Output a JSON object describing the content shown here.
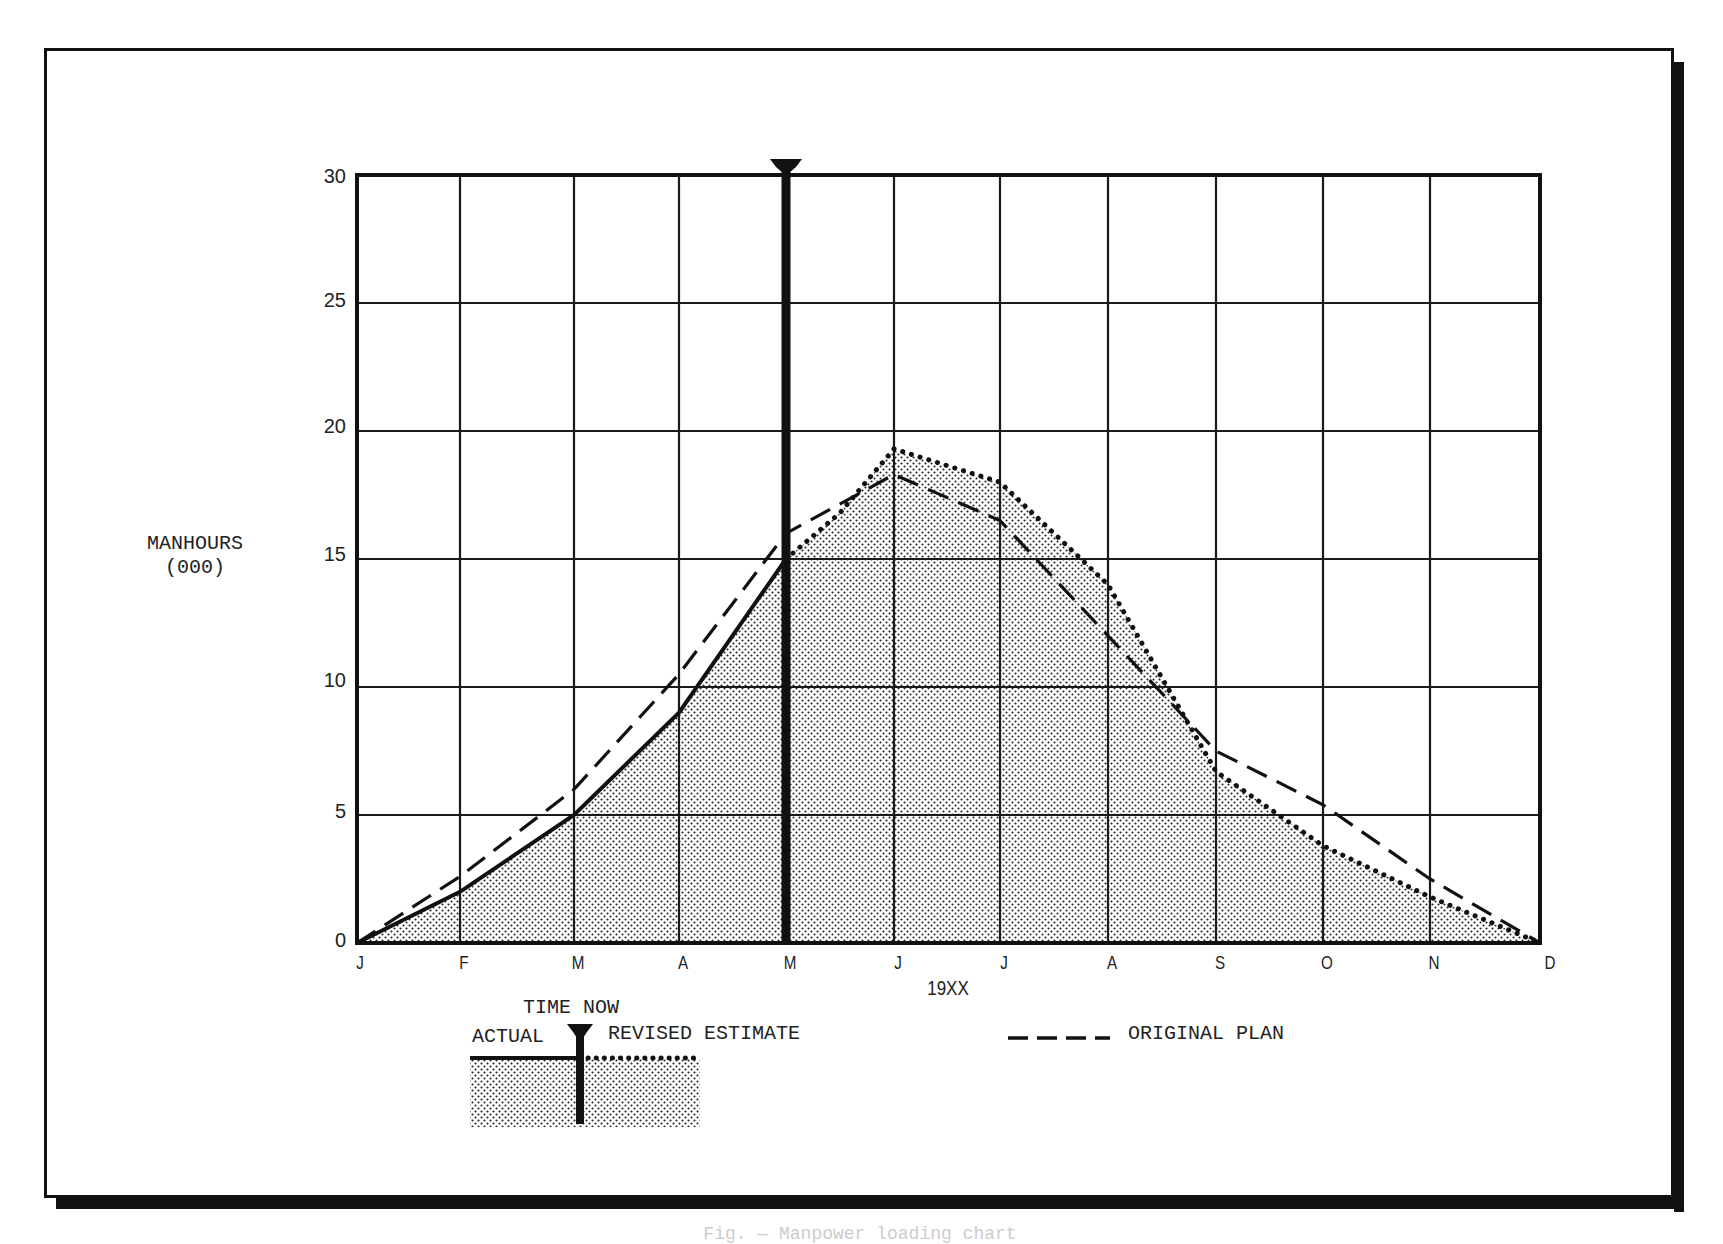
{
  "y_axis": {
    "title_line1": "MANHOURS",
    "title_line2": "(000)",
    "ticks": [
      "0",
      "5",
      "10",
      "15",
      "20",
      "25",
      "30"
    ]
  },
  "x_axis": {
    "title": "19XX",
    "ticks": [
      "J",
      "F",
      "M",
      "A",
      "M",
      "J",
      "J",
      "A",
      "S",
      "O",
      "N",
      "D"
    ]
  },
  "legend": {
    "time_now": "TIME NOW",
    "actual": "ACTUAL",
    "revised": "REVISED ESTIMATE",
    "original": "ORIGINAL PLAN"
  },
  "caption": "Fig. — Manpower loading chart",
  "colors": {
    "ink": "#111111",
    "grid": "#1a1a1a",
    "fill_dot": "#222222",
    "background": "#ffffff"
  },
  "chart_data": {
    "type": "line",
    "title": "",
    "xlabel": "19XX",
    "ylabel": "MANHOURS (000)",
    "ylim": [
      0,
      30
    ],
    "grid": true,
    "legend_position": "bottom",
    "categories": [
      "J",
      "F",
      "M",
      "A",
      "M",
      "J",
      "J",
      "A",
      "S",
      "O",
      "N",
      "D"
    ],
    "time_now_marker": "M (May)",
    "series": [
      {
        "name": "ACTUAL",
        "style": "solid",
        "filled": true,
        "values": [
          0,
          2,
          5,
          9,
          15,
          null,
          null,
          null,
          null,
          null,
          null,
          null
        ]
      },
      {
        "name": "REVISED ESTIMATE",
        "style": "dotted",
        "filled": true,
        "values": [
          null,
          null,
          null,
          null,
          15,
          19.3,
          18,
          14,
          6.7,
          3.8,
          1.8,
          0
        ]
      },
      {
        "name": "ORIGINAL PLAN",
        "style": "dashed",
        "filled": false,
        "values": [
          0,
          2.6,
          6,
          10.5,
          16,
          18.3,
          16.5,
          12,
          7.5,
          5.4,
          2.5,
          0
        ]
      }
    ]
  }
}
